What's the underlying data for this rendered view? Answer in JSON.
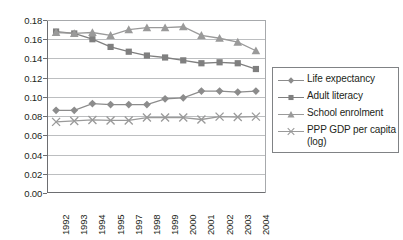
{
  "chart_data": {
    "type": "line",
    "title": "",
    "subtitle": "",
    "xlabel": "",
    "ylabel": "",
    "ylim": [
      0.0,
      0.18
    ],
    "ytick_step": 0.02,
    "yticks": [
      "0.18",
      "0.16",
      "0.14",
      "0.12",
      "0.10",
      "0.08",
      "0.06",
      "0.04",
      "0.02",
      "0.00"
    ],
    "ytick_values": [
      0.18,
      0.16,
      0.14,
      0.12,
      0.1,
      0.08,
      0.06,
      0.04,
      0.02,
      0.0
    ],
    "grid": true,
    "grid_axis": "y",
    "legend_position": "right",
    "categories": [
      "1992",
      "1993",
      "1994",
      "1995",
      "1997",
      "1998",
      "1999",
      "2000",
      "2001",
      "2002",
      "2003",
      "2004"
    ],
    "series": [
      {
        "name": "Life expectancy",
        "marker": "diamond",
        "color": "#8c8c8c",
        "values": [
          0.086,
          0.086,
          0.093,
          0.092,
          0.092,
          0.092,
          0.098,
          0.099,
          0.106,
          0.106,
          0.105,
          0.106
        ]
      },
      {
        "name": "Adult literacy",
        "marker": "square",
        "color": "#7f7f7f",
        "values": [
          0.168,
          0.166,
          0.16,
          0.152,
          0.147,
          0.143,
          0.141,
          0.138,
          0.135,
          0.136,
          0.135,
          0.129
        ]
      },
      {
        "name": "School enrolment",
        "marker": "triangle",
        "color": "#9a9a9a",
        "values": [
          0.167,
          0.166,
          0.167,
          0.164,
          0.17,
          0.172,
          0.172,
          0.173,
          0.164,
          0.161,
          0.157,
          0.148
        ]
      },
      {
        "name": "PPP GDP per capita\n(log)",
        "marker": "x",
        "color": "#9a9a9a",
        "values": [
          0.074,
          0.075,
          0.076,
          0.0755,
          0.0755,
          0.0785,
          0.0785,
          0.0785,
          0.0765,
          0.0795,
          0.079,
          0.0795
        ]
      }
    ]
  },
  "legend": {
    "items": [
      {
        "label": "Life expectancy"
      },
      {
        "label": "Adult literacy"
      },
      {
        "label": "School enrolment"
      },
      {
        "label": "PPP GDP per capita\n(log)"
      }
    ]
  }
}
